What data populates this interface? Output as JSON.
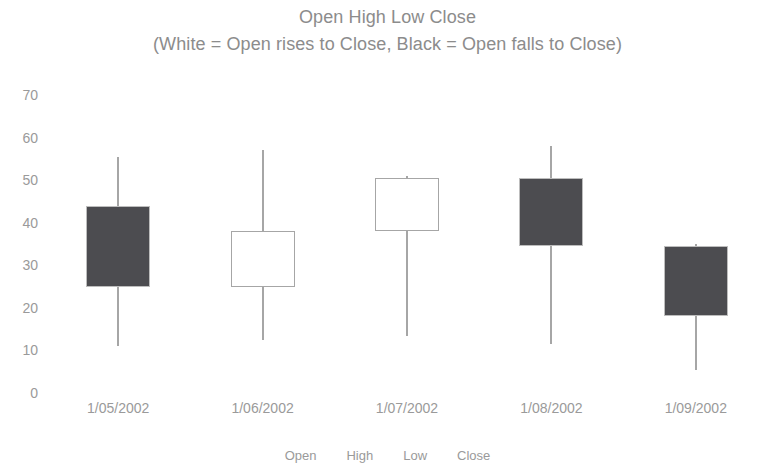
{
  "chart_data": {
    "type": "candlestick",
    "title": "Open High Low Close",
    "subtitle": "(White = Open rises to Close, Black = Open falls to Close)",
    "xlabel": "",
    "ylabel": "",
    "ylim": [
      0,
      70
    ],
    "y_ticks": [
      70,
      60,
      50,
      40,
      30,
      20,
      10,
      0
    ],
    "grid": false,
    "legend_position": "bottom",
    "legend": [
      "Open",
      "High",
      "Low",
      "Close"
    ],
    "categories": [
      "1/05/2002",
      "1/06/2002",
      "1/07/2002",
      "1/08/2002",
      "1/09/2002"
    ],
    "series": [
      {
        "name": "Open",
        "values": [
          44,
          25,
          38,
          50.5,
          34.5
        ]
      },
      {
        "name": "High",
        "values": [
          55.5,
          57,
          51,
          58,
          35
        ]
      },
      {
        "name": "Low",
        "values": [
          11,
          12.5,
          13.5,
          11.5,
          5.5
        ]
      },
      {
        "name": "Close",
        "values": [
          25,
          38,
          50.5,
          34.5,
          18
        ]
      }
    ],
    "points": [
      {
        "date": "1/05/2002",
        "open": 44,
        "high": 55.5,
        "low": 11,
        "close": 25,
        "direction": "down"
      },
      {
        "date": "1/06/2002",
        "open": 25,
        "high": 57,
        "low": 12.5,
        "close": 38,
        "direction": "up"
      },
      {
        "date": "1/07/2002",
        "open": 38,
        "high": 51,
        "low": 13.5,
        "close": 50.5,
        "direction": "up"
      },
      {
        "date": "1/08/2002",
        "open": 50.5,
        "high": 58,
        "low": 11.5,
        "close": 34.5,
        "direction": "down"
      },
      {
        "date": "1/09/2002",
        "open": 34.5,
        "high": 35,
        "low": 5.5,
        "close": 18,
        "direction": "down"
      }
    ],
    "colors": {
      "up_fill": "#ffffff",
      "down_fill": "#4c4c50",
      "border": "#a6a6a6",
      "wick": "#a6a6a6",
      "text": "#9a9a9a",
      "title": "#8c8c8c",
      "background": "#ffffff"
    }
  }
}
